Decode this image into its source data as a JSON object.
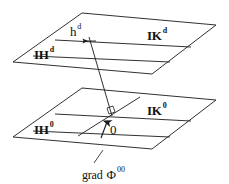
{
  "figure": {
    "stroke_color": "#1a1a1a",
    "background_color": "#ffffff",
    "labels": {
      "upper_plane_left": {
        "base": "IH",
        "sup": "d"
      },
      "upper_plane_right": {
        "base": "IK",
        "sup": "d"
      },
      "upper_plane_inner": {
        "base": "h",
        "sup": "d"
      },
      "lower_plane_left": {
        "base": "IH",
        "sup": "0"
      },
      "lower_plane_right": {
        "base": "IK",
        "sup": "0"
      },
      "origin": {
        "base": "0",
        "sup": ""
      },
      "gradient": {
        "base": "grad",
        "phi": "Φ",
        "sup": "00"
      }
    }
  }
}
